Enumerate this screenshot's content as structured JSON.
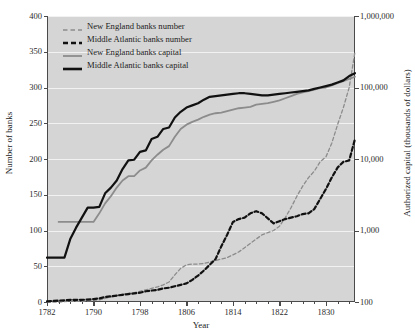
{
  "chart_data": {
    "type": "line",
    "title": "",
    "xlabel": "Year",
    "ylabel": "Number of banks",
    "y2label": "Authorized capital (thousands of dollars)",
    "xlim": [
      1782,
      1835
    ],
    "ylim": [
      0,
      400
    ],
    "xticks": [
      1782,
      1790,
      1798,
      1806,
      1814,
      1822,
      1830
    ],
    "yticks": [
      0,
      50,
      100,
      150,
      200,
      250,
      300,
      350,
      400
    ],
    "y2ticks": [
      "100",
      "1,000",
      "10,000",
      "100,000",
      "1,000,000"
    ],
    "y2scale": "log",
    "grid": true,
    "legend_position": "top-left",
    "background": "#d5d5d5",
    "series": [
      {
        "name": "New England banks number",
        "axis": "left",
        "style": "dashed",
        "color": "#8c8c8c",
        "width": 1.3,
        "points": [
          [
            1782,
            0
          ],
          [
            1784,
            0
          ],
          [
            1786,
            1
          ],
          [
            1788,
            1
          ],
          [
            1790,
            2
          ],
          [
            1791,
            3
          ],
          [
            1792,
            5
          ],
          [
            1793,
            7
          ],
          [
            1794,
            9
          ],
          [
            1795,
            11
          ],
          [
            1796,
            12
          ],
          [
            1797,
            13
          ],
          [
            1798,
            15
          ],
          [
            1799,
            17
          ],
          [
            1800,
            19
          ],
          [
            1801,
            21
          ],
          [
            1802,
            24
          ],
          [
            1803,
            28
          ],
          [
            1804,
            38
          ],
          [
            1805,
            47
          ],
          [
            1806,
            52
          ],
          [
            1807,
            53
          ],
          [
            1808,
            53
          ],
          [
            1809,
            54
          ],
          [
            1810,
            56
          ],
          [
            1811,
            58
          ],
          [
            1812,
            60
          ],
          [
            1813,
            62
          ],
          [
            1814,
            66
          ],
          [
            1815,
            70
          ],
          [
            1816,
            76
          ],
          [
            1817,
            82
          ],
          [
            1818,
            88
          ],
          [
            1819,
            94
          ],
          [
            1820,
            97
          ],
          [
            1821,
            100
          ],
          [
            1822,
            106
          ],
          [
            1823,
            118
          ],
          [
            1824,
            132
          ],
          [
            1825,
            148
          ],
          [
            1826,
            162
          ],
          [
            1827,
            174
          ],
          [
            1828,
            183
          ],
          [
            1829,
            196
          ],
          [
            1830,
            203
          ],
          [
            1831,
            222
          ],
          [
            1832,
            248
          ],
          [
            1833,
            272
          ],
          [
            1834,
            300
          ],
          [
            1835,
            350
          ]
        ]
      },
      {
        "name": "Middle Atlantic banks number",
        "axis": "left",
        "style": "dashed",
        "color": "#111111",
        "width": 2.2,
        "points": [
          [
            1782,
            1
          ],
          [
            1784,
            2
          ],
          [
            1786,
            3
          ],
          [
            1788,
            3
          ],
          [
            1790,
            4
          ],
          [
            1791,
            5
          ],
          [
            1792,
            7
          ],
          [
            1793,
            8
          ],
          [
            1794,
            9
          ],
          [
            1795,
            10
          ],
          [
            1796,
            11
          ],
          [
            1797,
            12
          ],
          [
            1798,
            13
          ],
          [
            1799,
            15
          ],
          [
            1800,
            16
          ],
          [
            1801,
            17
          ],
          [
            1802,
            19
          ],
          [
            1803,
            20
          ],
          [
            1804,
            22
          ],
          [
            1805,
            24
          ],
          [
            1806,
            26
          ],
          [
            1807,
            31
          ],
          [
            1808,
            37
          ],
          [
            1809,
            44
          ],
          [
            1810,
            52
          ],
          [
            1811,
            60
          ],
          [
            1812,
            78
          ],
          [
            1813,
            94
          ],
          [
            1814,
            112
          ],
          [
            1815,
            116
          ],
          [
            1816,
            118
          ],
          [
            1817,
            124
          ],
          [
            1818,
            127
          ],
          [
            1819,
            124
          ],
          [
            1820,
            117
          ],
          [
            1821,
            110
          ],
          [
            1822,
            113
          ],
          [
            1823,
            116
          ],
          [
            1824,
            118
          ],
          [
            1825,
            120
          ],
          [
            1826,
            123
          ],
          [
            1827,
            124
          ],
          [
            1828,
            130
          ],
          [
            1829,
            144
          ],
          [
            1830,
            158
          ],
          [
            1831,
            174
          ],
          [
            1832,
            188
          ],
          [
            1833,
            196
          ],
          [
            1834,
            198
          ],
          [
            1835,
            228
          ]
        ]
      },
      {
        "name": "New England banks capital",
        "axis": "right",
        "style": "solid",
        "color": "#8c8c8c",
        "width": 1.8,
        "points": [
          [
            1784,
            112
          ],
          [
            1790,
            112
          ],
          [
            1791,
            124
          ],
          [
            1792,
            138
          ],
          [
            1793,
            148
          ],
          [
            1794,
            160
          ],
          [
            1795,
            170
          ],
          [
            1796,
            176
          ],
          [
            1797,
            176
          ],
          [
            1798,
            184
          ],
          [
            1799,
            188
          ],
          [
            1800,
            198
          ],
          [
            1801,
            206
          ],
          [
            1802,
            213
          ],
          [
            1803,
            218
          ],
          [
            1804,
            231
          ],
          [
            1805,
            242
          ],
          [
            1806,
            248
          ],
          [
            1807,
            252
          ],
          [
            1808,
            255
          ],
          [
            1809,
            259
          ],
          [
            1810,
            262
          ],
          [
            1811,
            264
          ],
          [
            1812,
            265
          ],
          [
            1813,
            267
          ],
          [
            1814,
            269
          ],
          [
            1815,
            271
          ],
          [
            1816,
            272
          ],
          [
            1817,
            273
          ],
          [
            1818,
            276
          ],
          [
            1819,
            277
          ],
          [
            1820,
            278
          ],
          [
            1821,
            280
          ],
          [
            1822,
            282
          ],
          [
            1823,
            285
          ],
          [
            1824,
            288
          ],
          [
            1825,
            291
          ],
          [
            1826,
            293
          ],
          [
            1827,
            295
          ],
          [
            1828,
            297
          ],
          [
            1829,
            299
          ],
          [
            1830,
            300
          ],
          [
            1831,
            303
          ],
          [
            1832,
            306
          ],
          [
            1833,
            309
          ],
          [
            1834,
            312
          ],
          [
            1835,
            315
          ]
        ]
      },
      {
        "name": "Middle Atlantic banks capital",
        "axis": "right",
        "style": "solid",
        "color": "#111111",
        "width": 2.2,
        "points": [
          [
            1782,
            62
          ],
          [
            1785,
            62
          ],
          [
            1786,
            88
          ],
          [
            1787,
            104
          ],
          [
            1788,
            118
          ],
          [
            1789,
            132
          ],
          [
            1790,
            132
          ],
          [
            1791,
            133
          ],
          [
            1792,
            152
          ],
          [
            1793,
            160
          ],
          [
            1794,
            170
          ],
          [
            1795,
            186
          ],
          [
            1796,
            198
          ],
          [
            1797,
            199
          ],
          [
            1798,
            210
          ],
          [
            1799,
            212
          ],
          [
            1800,
            228
          ],
          [
            1801,
            231
          ],
          [
            1802,
            242
          ],
          [
            1803,
            244
          ],
          [
            1804,
            258
          ],
          [
            1805,
            266
          ],
          [
            1806,
            272
          ],
          [
            1807,
            275
          ],
          [
            1808,
            278
          ],
          [
            1809,
            283
          ],
          [
            1810,
            287
          ],
          [
            1811,
            288
          ],
          [
            1812,
            289
          ],
          [
            1813,
            290
          ],
          [
            1814,
            291
          ],
          [
            1815,
            292
          ],
          [
            1816,
            292
          ],
          [
            1817,
            291
          ],
          [
            1818,
            290
          ],
          [
            1819,
            289
          ],
          [
            1820,
            289
          ],
          [
            1821,
            290
          ],
          [
            1822,
            291
          ],
          [
            1823,
            292
          ],
          [
            1824,
            293
          ],
          [
            1825,
            294
          ],
          [
            1826,
            295
          ],
          [
            1827,
            296
          ],
          [
            1828,
            298
          ],
          [
            1829,
            300
          ],
          [
            1830,
            302
          ],
          [
            1831,
            304
          ],
          [
            1832,
            307
          ],
          [
            1833,
            310
          ],
          [
            1834,
            316
          ],
          [
            1835,
            320
          ]
        ]
      }
    ],
    "legend": [
      {
        "label": "New England banks number",
        "style": "dashed",
        "color": "#8c8c8c",
        "width": 1.6
      },
      {
        "label": "Middle Atlantic banks number",
        "style": "dashed",
        "color": "#111111",
        "width": 2.6
      },
      {
        "label": "New England banks capital",
        "style": "solid",
        "color": "#8c8c8c",
        "width": 1.8
      },
      {
        "label": "Middle Atlantic banks capital",
        "style": "solid",
        "color": "#111111",
        "width": 2.6
      }
    ]
  }
}
